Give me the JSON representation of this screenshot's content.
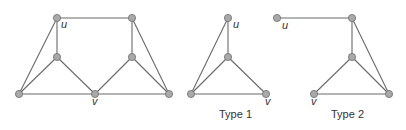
{
  "graphs": [
    {
      "id": "main",
      "nodes": [
        {
          "id": "u",
          "x": 57,
          "y": 18,
          "label": "u",
          "lx": 61,
          "ly": 22
        },
        {
          "id": "a",
          "x": 57,
          "y": 57
        },
        {
          "id": "bl",
          "x": 19,
          "y": 94
        },
        {
          "id": "v",
          "x": 95,
          "y": 94,
          "label": "v",
          "lx": 92,
          "ly": 99
        },
        {
          "id": "tr",
          "x": 132,
          "y": 18
        },
        {
          "id": "b",
          "x": 132,
          "y": 57
        },
        {
          "id": "br",
          "x": 169,
          "y": 94
        }
      ],
      "edges": [
        [
          "u",
          "tr"
        ],
        [
          "u",
          "a"
        ],
        [
          "u",
          "bl"
        ],
        [
          "a",
          "bl"
        ],
        [
          "a",
          "v"
        ],
        [
          "bl",
          "v"
        ],
        [
          "v",
          "br"
        ],
        [
          "v",
          "b"
        ],
        [
          "b",
          "tr"
        ],
        [
          "b",
          "br"
        ],
        [
          "tr",
          "br"
        ]
      ]
    },
    {
      "id": "type1",
      "caption": "Type 1",
      "cx": 236,
      "cy": 109,
      "nodes": [
        {
          "id": "u",
          "x": 228,
          "y": 18,
          "label": "u",
          "lx": 233,
          "ly": 22
        },
        {
          "id": "m",
          "x": 228,
          "y": 57
        },
        {
          "id": "bl",
          "x": 191,
          "y": 94
        },
        {
          "id": "v",
          "x": 266,
          "y": 94,
          "label": "v",
          "lx": 265,
          "ly": 99
        }
      ],
      "edges": [
        [
          "u",
          "m"
        ],
        [
          "u",
          "bl"
        ],
        [
          "m",
          "bl"
        ],
        [
          "m",
          "v"
        ],
        [
          "bl",
          "v"
        ]
      ]
    },
    {
      "id": "type2",
      "caption": "Type 2",
      "cx": 348,
      "cy": 109,
      "nodes": [
        {
          "id": "u",
          "x": 277,
          "y": 18,
          "label": "u",
          "lx": 282,
          "ly": 23
        },
        {
          "id": "t",
          "x": 352,
          "y": 18
        },
        {
          "id": "m",
          "x": 352,
          "y": 57
        },
        {
          "id": "v",
          "x": 314,
          "y": 94,
          "label": "v",
          "lx": 311,
          "ly": 99
        },
        {
          "id": "br",
          "x": 389,
          "y": 94
        }
      ],
      "edges": [
        [
          "u",
          "t"
        ],
        [
          "t",
          "m"
        ],
        [
          "t",
          "br"
        ],
        [
          "m",
          "v"
        ],
        [
          "m",
          "br"
        ],
        [
          "v",
          "br"
        ]
      ]
    }
  ],
  "colors": {
    "edge": "#6a6a6a",
    "node_fill": "#a9a9a9",
    "node_stroke": "#6e6e6e"
  }
}
